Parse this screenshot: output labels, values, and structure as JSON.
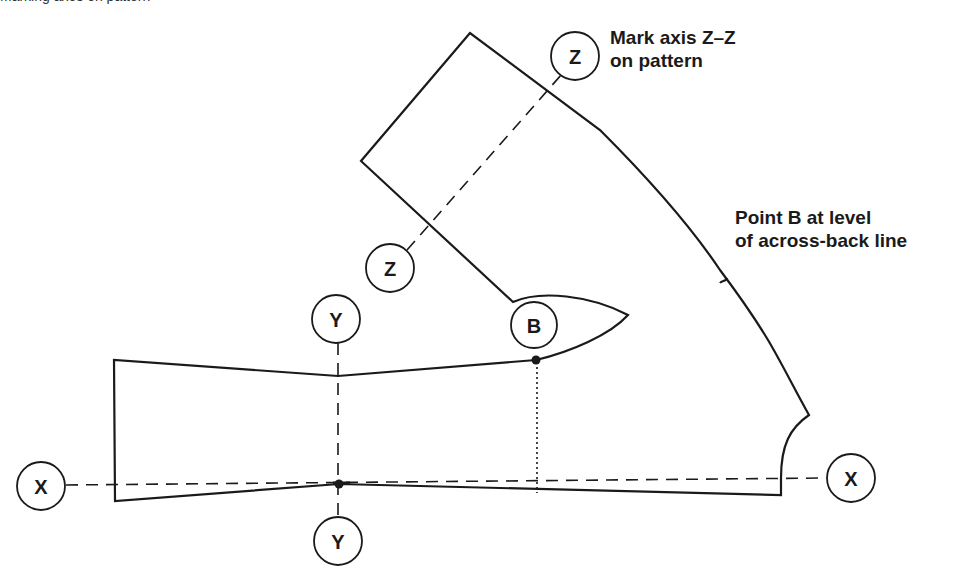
{
  "caption_fragment": "Marking axes on pattern",
  "annotations": {
    "axis_z": {
      "line1": "Mark axis Z–Z",
      "line2": "on pattern"
    },
    "point_b": {
      "line1": "Point B at level",
      "line2": "of across-back line"
    }
  },
  "markers": {
    "z_top": "Z",
    "z_bottom": "Z",
    "y_top": "Y",
    "y_bottom": "Y",
    "b": "B",
    "x_left": "X",
    "x_right": "X"
  },
  "colors": {
    "stroke": "#1a1a1a",
    "background": "#ffffff"
  }
}
